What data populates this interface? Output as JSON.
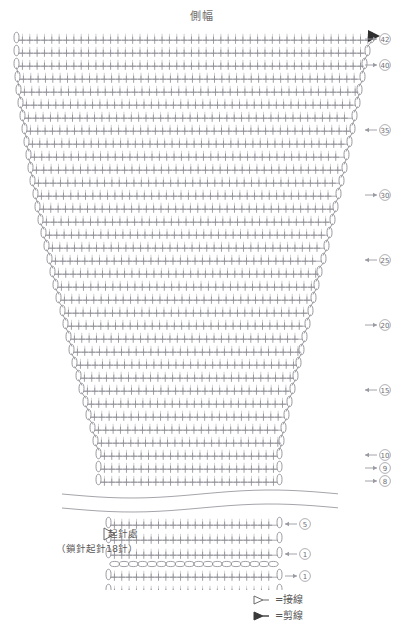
{
  "title": "側幅",
  "legend": {
    "items": [
      {
        "glyph": "open-triangle",
        "label": "=接線"
      },
      {
        "glyph": "filled-triangle",
        "label": "=剪線"
      }
    ]
  },
  "start_note": {
    "line1": "起針處",
    "line2": "（鎖針起針18針）"
  },
  "chart_data": {
    "type": "table",
    "title": "側幅",
    "stitch_symbol": "+",
    "edge_symbol": "chain-oval",
    "foundation_chain_count": 18,
    "break_marker": "wavy-omission",
    "markers": [
      {
        "type": "filled-triangle",
        "meaning": "剪線",
        "position": "top-right"
      },
      {
        "type": "open-triangle",
        "meaning": "接線",
        "position": "bottom-left"
      }
    ],
    "row_labels": [
      {
        "row": 42,
        "side": "right",
        "arrow": "right"
      },
      {
        "row": 40,
        "side": "right",
        "arrow": "right"
      },
      {
        "row": 35,
        "side": "right",
        "arrow": "left"
      },
      {
        "row": 30,
        "side": "right",
        "arrow": "right"
      },
      {
        "row": 25,
        "side": "right",
        "arrow": "left"
      },
      {
        "row": 20,
        "side": "right",
        "arrow": "right"
      },
      {
        "row": 15,
        "side": "right",
        "arrow": "left"
      },
      {
        "row": 10,
        "side": "right",
        "arrow": "left"
      },
      {
        "row": 9,
        "side": "right",
        "arrow": "right"
      },
      {
        "row": 8,
        "side": "right",
        "arrow": "right"
      },
      {
        "row": 5,
        "side": "right",
        "arrow": "left"
      },
      {
        "row": 3,
        "side": "right",
        "arrow": "right"
      },
      {
        "row": 1,
        "side": "right",
        "arrow": "left"
      },
      {
        "row": 1,
        "side": "right",
        "arrow": "right"
      },
      {
        "row": 3,
        "side": "right",
        "arrow": "right"
      }
    ],
    "rows": [
      {
        "index": 42,
        "label": "42",
        "arrow": "right",
        "cells": 47,
        "y": 8,
        "left": 18,
        "right": 370
      },
      {
        "index": 41,
        "label": "",
        "arrow": "",
        "cells": 47,
        "y": 21,
        "left": 18,
        "right": 366
      },
      {
        "index": 40,
        "label": "40",
        "arrow": "right",
        "cells": 46,
        "y": 34,
        "left": 18,
        "right": 363
      },
      {
        "index": 39,
        "label": "",
        "arrow": "",
        "cells": 46,
        "y": 47,
        "left": 19,
        "right": 361
      },
      {
        "index": 38,
        "label": "",
        "arrow": "",
        "cells": 45,
        "y": 60,
        "left": 20,
        "right": 358
      },
      {
        "index": 37,
        "label": "",
        "arrow": "",
        "cells": 45,
        "y": 73,
        "left": 22,
        "right": 356
      },
      {
        "index": 36,
        "label": "",
        "arrow": "",
        "cells": 44,
        "y": 86,
        "left": 24,
        "right": 353
      },
      {
        "index": 35,
        "label": "35",
        "arrow": "left",
        "cells": 44,
        "y": 99,
        "left": 26,
        "right": 351
      },
      {
        "index": 34,
        "label": "",
        "arrow": "",
        "cells": 43,
        "y": 112,
        "left": 28,
        "right": 348
      },
      {
        "index": 33,
        "label": "",
        "arrow": "",
        "cells": 43,
        "y": 125,
        "left": 30,
        "right": 345
      },
      {
        "index": 32,
        "label": "",
        "arrow": "",
        "cells": 42,
        "y": 138,
        "left": 32,
        "right": 343
      },
      {
        "index": 31,
        "label": "",
        "arrow": "",
        "cells": 42,
        "y": 151,
        "left": 34,
        "right": 340
      },
      {
        "index": 30,
        "label": "30",
        "arrow": "right",
        "cells": 41,
        "y": 164,
        "left": 37,
        "right": 337
      },
      {
        "index": 29,
        "label": "",
        "arrow": "",
        "cells": 41,
        "y": 177,
        "left": 39,
        "right": 334
      },
      {
        "index": 28,
        "label": "",
        "arrow": "",
        "cells": 40,
        "y": 190,
        "left": 42,
        "right": 331
      },
      {
        "index": 27,
        "label": "",
        "arrow": "",
        "cells": 40,
        "y": 203,
        "left": 45,
        "right": 328
      },
      {
        "index": 26,
        "label": "",
        "arrow": "",
        "cells": 39,
        "y": 216,
        "left": 48,
        "right": 325
      },
      {
        "index": 25,
        "label": "25",
        "arrow": "left",
        "cells": 39,
        "y": 229,
        "left": 51,
        "right": 322
      },
      {
        "index": 24,
        "label": "",
        "arrow": "",
        "cells": 38,
        "y": 242,
        "left": 54,
        "right": 318
      },
      {
        "index": 23,
        "label": "",
        "arrow": "",
        "cells": 38,
        "y": 255,
        "left": 57,
        "right": 315
      },
      {
        "index": 22,
        "label": "",
        "arrow": "",
        "cells": 37,
        "y": 268,
        "left": 60,
        "right": 312
      },
      {
        "index": 21,
        "label": "",
        "arrow": "",
        "cells": 37,
        "y": 281,
        "left": 64,
        "right": 309
      },
      {
        "index": 20,
        "label": "20",
        "arrow": "right",
        "cells": 36,
        "y": 294,
        "left": 67,
        "right": 306
      },
      {
        "index": 19,
        "label": "",
        "arrow": "",
        "cells": 36,
        "y": 307,
        "left": 70,
        "right": 303
      },
      {
        "index": 18,
        "label": "",
        "arrow": "",
        "cells": 35,
        "y": 320,
        "left": 73,
        "right": 300
      },
      {
        "index": 17,
        "label": "",
        "arrow": "",
        "cells": 35,
        "y": 333,
        "left": 76,
        "right": 297
      },
      {
        "index": 16,
        "label": "",
        "arrow": "",
        "cells": 34,
        "y": 346,
        "left": 80,
        "right": 294
      },
      {
        "index": 15,
        "label": "15",
        "arrow": "left",
        "cells": 34,
        "y": 359,
        "left": 83,
        "right": 291
      },
      {
        "index": 14,
        "label": "",
        "arrow": "",
        "cells": 33,
        "y": 372,
        "left": 87,
        "right": 288
      },
      {
        "index": 13,
        "label": "",
        "arrow": "",
        "cells": 33,
        "y": 385,
        "left": 90,
        "right": 285
      },
      {
        "index": 12,
        "label": "",
        "arrow": "",
        "cells": 32,
        "y": 398,
        "left": 94,
        "right": 282
      },
      {
        "index": 11,
        "label": "",
        "arrow": "",
        "cells": 32,
        "y": 411,
        "left": 97,
        "right": 280
      },
      {
        "index": 10,
        "label": "10",
        "arrow": "left",
        "cells": 31,
        "y": 424,
        "left": 100,
        "right": 278
      },
      {
        "index": 9,
        "label": "9",
        "arrow": "right",
        "cells": 31,
        "y": 437,
        "left": 100,
        "right": 278
      },
      {
        "index": 8,
        "label": "8",
        "arrow": "right",
        "cells": 31,
        "y": 450,
        "left": 100,
        "right": 278
      }
    ],
    "rows_lower": [
      {
        "index": 5,
        "label": "5",
        "arrow": "left",
        "cells": 31,
        "y": 493,
        "left": 110,
        "right": 278
      },
      {
        "index": 4,
        "label": "",
        "arrow": "right",
        "cells": 31,
        "y": 508,
        "left": 110,
        "right": 278
      },
      {
        "index": 3,
        "label": "1",
        "arrow": "left",
        "cells": 31,
        "y": 523,
        "left": 110,
        "right": 278
      },
      {
        "index": 2,
        "label": "1",
        "arrow": "right",
        "cells": 31,
        "y": 545,
        "left": 110,
        "right": 278
      },
      {
        "index": 1,
        "label": "",
        "arrow": "left",
        "cells": 31,
        "y": 560,
        "left": 110,
        "right": 278
      },
      {
        "index": 0,
        "label": "3",
        "arrow": "right",
        "cells": 31,
        "y": 578,
        "left": 110,
        "right": 278
      }
    ]
  }
}
